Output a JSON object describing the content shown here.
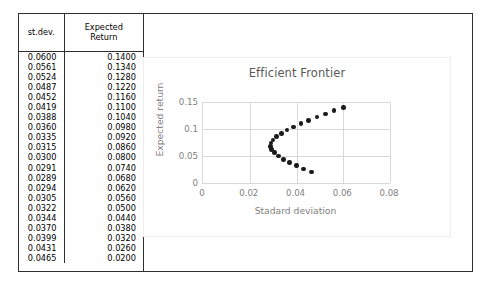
{
  "table": {
    "headers": [
      "st.dev.",
      "Expected Return"
    ],
    "header_lines": [
      [
        "st.dev."
      ],
      [
        "Expected",
        "Return"
      ]
    ],
    "rows": [
      [
        "0.0600",
        "0.1400"
      ],
      [
        "0.0561",
        "0.1340"
      ],
      [
        "0.0524",
        "0.1280"
      ],
      [
        "0.0487",
        "0.1220"
      ],
      [
        "0.0452",
        "0.1160"
      ],
      [
        "0.0419",
        "0.1100"
      ],
      [
        "0.0388",
        "0.1040"
      ],
      [
        "0.0360",
        "0.0980"
      ],
      [
        "0.0335",
        "0.0920"
      ],
      [
        "0.0315",
        "0.0860"
      ],
      [
        "0.0300",
        "0.0800"
      ],
      [
        "0.0291",
        "0.0740"
      ],
      [
        "0.0289",
        "0.0680"
      ],
      [
        "0.0294",
        "0.0620"
      ],
      [
        "0.0305",
        "0.0560"
      ],
      [
        "0.0322",
        "0.0500"
      ],
      [
        "0.0344",
        "0.0440"
      ],
      [
        "0.0370",
        "0.0380"
      ],
      [
        "0.0399",
        "0.0320"
      ],
      [
        "0.0431",
        "0.0260"
      ],
      [
        "0.0465",
        "0.0200"
      ]
    ]
  },
  "chart_data": {
    "type": "scatter",
    "title": "Efficient Frontier",
    "xlabel": "Stadard deviation",
    "ylabel": "Expected return",
    "xlim": [
      0,
      0.08
    ],
    "ylim": [
      0,
      0.15
    ],
    "xticks": [
      "0",
      "0.02",
      "0.04",
      "0.06",
      "0.08"
    ],
    "xtick_values": [
      0,
      0.02,
      0.04,
      0.06,
      0.08
    ],
    "yticks": [
      "0",
      "0.05",
      "0.1",
      "0.15"
    ],
    "ytick_values": [
      0,
      0.05,
      0.1,
      0.15
    ],
    "grid": true,
    "legend": false,
    "marker_color": "#1a1a1a",
    "gridline_color": "#d9d9d9",
    "series": [
      {
        "name": "Efficient Frontier",
        "x": [
          0.06,
          0.0561,
          0.0524,
          0.0487,
          0.0452,
          0.0419,
          0.0388,
          0.036,
          0.0335,
          0.0315,
          0.03,
          0.0291,
          0.0289,
          0.0294,
          0.0305,
          0.0322,
          0.0344,
          0.037,
          0.0399,
          0.0431,
          0.0465
        ],
        "y": [
          0.14,
          0.134,
          0.128,
          0.122,
          0.116,
          0.11,
          0.104,
          0.098,
          0.092,
          0.086,
          0.08,
          0.074,
          0.068,
          0.062,
          0.056,
          0.05,
          0.044,
          0.038,
          0.032,
          0.026,
          0.02
        ]
      }
    ]
  }
}
